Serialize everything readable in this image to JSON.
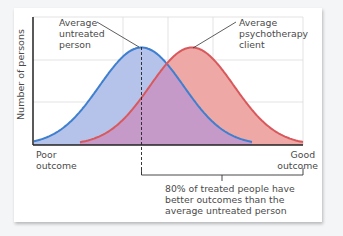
{
  "chart_data": {
    "type": "area",
    "title": "",
    "xlabel": "",
    "ylabel": "Number of persons",
    "x_tick_labels": {
      "left": [
        "Poor",
        "outcome"
      ],
      "right": [
        "Good",
        "outcome"
      ]
    },
    "grid": true,
    "legend": null,
    "series": [
      {
        "name": "Untreated persons",
        "distribution": "normal",
        "mean": 0.0,
        "sd": 1.0,
        "color": "#3f7fcf",
        "fill": "#b5c3ea"
      },
      {
        "name": "Psychotherapy clients",
        "distribution": "normal",
        "mean": 0.85,
        "sd": 1.0,
        "color": "#d9585c",
        "fill": "#eea9a6"
      }
    ],
    "overlap_fill": "#c69ac8",
    "annotations": [
      {
        "text": [
          "Average",
          "untreated",
          "person"
        ],
        "points_to": "peak of untreated curve"
      },
      {
        "text": [
          "Average",
          "psychotherapy",
          "client"
        ],
        "points_to": "peak of psychotherapy curve"
      },
      {
        "text": [
          "80% of treated people have",
          "better outcomes than the",
          "average untreated person"
        ],
        "points_to": "bracket from untreated mean to good outcome"
      }
    ]
  },
  "labels": {
    "ylabel": "Number of persons",
    "untreated": [
      "Average",
      "untreated",
      "person"
    ],
    "client": [
      "Average",
      "psychotherapy",
      "client"
    ],
    "poor": [
      "Poor",
      "outcome"
    ],
    "good": [
      "Good",
      "outcome"
    ],
    "note": [
      "80% of treated people have",
      "better outcomes than the",
      "average untreated person"
    ]
  },
  "colors": {
    "blue_line": "#3f7fcf",
    "blue_fill": "#b5c3ea",
    "red_line": "#d9585c",
    "red_fill": "#eea9a6",
    "overlap": "#c69ac8",
    "grid": "#dcdcdc",
    "axis": "#222222"
  }
}
